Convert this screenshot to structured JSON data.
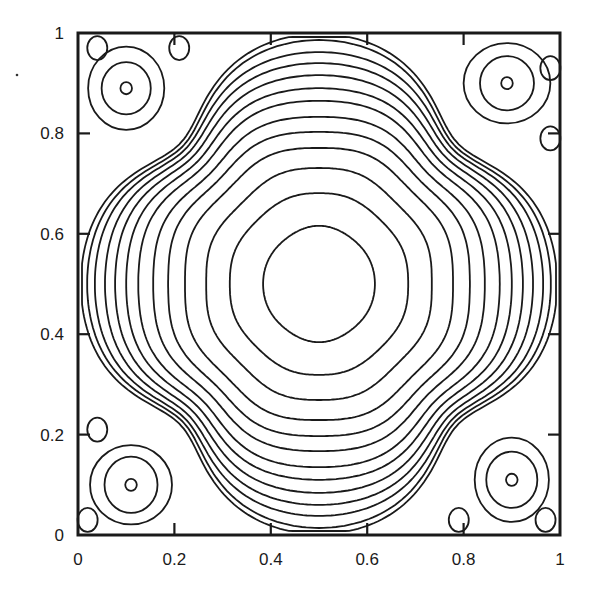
{
  "chart_data": {
    "type": "contour",
    "title": "",
    "xlabel": "",
    "ylabel": "",
    "xlim": [
      0,
      1
    ],
    "ylim": [
      0,
      1
    ],
    "grid": false,
    "legend": null,
    "x_ticks": [
      "0",
      "0.2",
      "0.4",
      "0.6",
      "0.8",
      "1"
    ],
    "y_ticks": [
      "0",
      "0.2",
      "0.4",
      "0.6",
      "0.8",
      "1"
    ],
    "x_tick_values": [
      0,
      0.2,
      0.4,
      0.6,
      0.8,
      1
    ],
    "y_tick_values": [
      0,
      0.2,
      0.4,
      0.6,
      0.8,
      1
    ],
    "primary_vortex": {
      "center": [
        0.5,
        0.5
      ],
      "contour_count": 13,
      "half_width_x": [
        0.116,
        0.185,
        0.234,
        0.278,
        0.313,
        0.344,
        0.375,
        0.4,
        0.423,
        0.444,
        0.465,
        0.481,
        0.494
      ],
      "half_width_y": [
        0.116,
        0.181,
        0.231,
        0.271,
        0.303,
        0.333,
        0.365,
        0.39,
        0.416,
        0.44,
        0.462,
        0.486,
        0.498
      ],
      "diagonal_radius": [
        0.116,
        0.184,
        0.232,
        0.272,
        0.3,
        0.322,
        0.342,
        0.358,
        0.372,
        0.384,
        0.394,
        0.402,
        0.41
      ]
    },
    "corner_vortices": [
      {
        "name": "top-left",
        "center": [
          0.1,
          0.89
        ],
        "rings": [
          [
            0.012,
            0.012
          ],
          [
            0.051,
            0.052
          ],
          [
            0.079,
            0.083
          ]
        ]
      },
      {
        "name": "top-right",
        "center": [
          0.89,
          0.9
        ],
        "rings": [
          [
            0.012,
            0.012
          ],
          [
            0.056,
            0.054
          ],
          [
            0.09,
            0.08
          ]
        ]
      },
      {
        "name": "bottom-left",
        "center": [
          0.11,
          0.1
        ],
        "rings": [
          [
            0.012,
            0.012
          ],
          [
            0.055,
            0.056
          ],
          [
            0.085,
            0.079
          ]
        ]
      },
      {
        "name": "bottom-right",
        "center": [
          0.9,
          0.11
        ],
        "rings": [
          [
            0.012,
            0.012
          ],
          [
            0.053,
            0.056
          ],
          [
            0.077,
            0.084
          ]
        ]
      }
    ],
    "secondary_eddies": [
      {
        "location": "top-left corner",
        "center": [
          0.04,
          0.97
        ]
      },
      {
        "location": "top wall near x=0.2",
        "center": [
          0.21,
          0.97
        ]
      },
      {
        "location": "top-right corner",
        "center": [
          0.98,
          0.93
        ]
      },
      {
        "location": "right wall near y=0.8",
        "center": [
          0.98,
          0.79
        ]
      },
      {
        "location": "left wall near y=0.2",
        "center": [
          0.04,
          0.21
        ]
      },
      {
        "location": "bottom-left corner",
        "center": [
          0.02,
          0.03
        ]
      },
      {
        "location": "bottom wall near x=0.8",
        "center": [
          0.79,
          0.03
        ]
      },
      {
        "location": "bottom-right corner",
        "center": [
          0.97,
          0.03
        ]
      }
    ]
  },
  "axes": {
    "frame_px": {
      "left": 78,
      "top": 33,
      "right": 560,
      "bottom": 535
    }
  },
  "colors": {
    "line": "#1a1a1a",
    "background": "#ffffff"
  }
}
